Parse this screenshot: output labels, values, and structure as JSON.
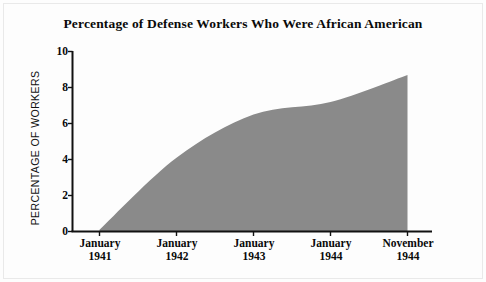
{
  "chart_data": {
    "type": "area",
    "title": "Percentage of Defense Workers Who Were African American",
    "xlabel": "",
    "ylabel": "PERCENTAGE OF WORKERS",
    "categories": [
      "January 1941",
      "January 1942",
      "January 1943",
      "January 1944",
      "November 1944"
    ],
    "x_tick_lines": [
      {
        "month": "January",
        "year": "1941"
      },
      {
        "month": "January",
        "year": "1942"
      },
      {
        "month": "January",
        "year": "1943"
      },
      {
        "month": "January",
        "year": "1944"
      },
      {
        "month": "November",
        "year": "1944"
      }
    ],
    "values": [
      0.1,
      4.1,
      6.5,
      7.2,
      8.7
    ],
    "series": [
      {
        "name": "Percentage of defense workers who were African American",
        "values": [
          0.1,
          4.1,
          6.5,
          7.2,
          8.7
        ]
      }
    ],
    "ylim": [
      0,
      10
    ],
    "yticks": [
      0,
      2,
      4,
      6,
      8,
      10
    ],
    "ytick_labels": [
      "0",
      "2",
      "4",
      "6",
      "8",
      "10"
    ],
    "grid": false,
    "legend": false,
    "legend_position": "none",
    "area_fill_color": "#8a8a8a",
    "axis_color": "#111111",
    "background_color": "#fdfdfd",
    "title_color": "#0a0a0a"
  }
}
